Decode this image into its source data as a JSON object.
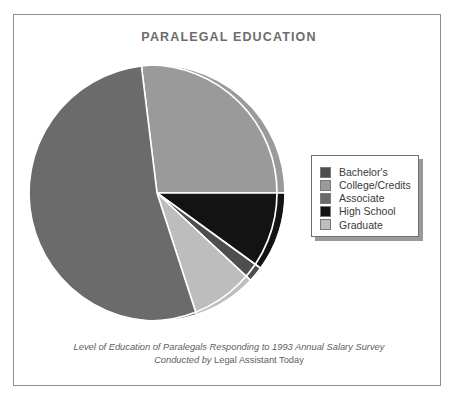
{
  "figure": {
    "title": "PARALEGAL EDUCATION",
    "caption_line1": "Level of Education of Paralegals Responding to 1993 Annual Salary Survey",
    "caption_line2_prefix": "Conducted by ",
    "caption_line2_source": "Legal Assistant Today",
    "frame_color": "#8d8d8d",
    "background": "#ffffff",
    "title_color": "#6c6c6c",
    "caption_color": "#5e5e5e"
  },
  "legend": {
    "position": "right-middle",
    "border_color": "#6f6f6f",
    "shadow_color": "#9a9a9a",
    "items": [
      {
        "label": "Bachelor's",
        "color": "#4e4e4e"
      },
      {
        "label": "College/Credits",
        "color": "#9a9a9a"
      },
      {
        "label": "Associate",
        "color": "#6b6b6b"
      },
      {
        "label": "High School",
        "color": "#131313"
      },
      {
        "label": "Graduate",
        "color": "#bdbdbd"
      }
    ]
  },
  "chart_data": {
    "type": "pie",
    "title": "PARALEGAL EDUCATION",
    "subtitle": "Level of Education of Paralegals Responding to 1993 Annual Salary Survey",
    "source": "Conducted by Legal Assistant Today",
    "legend_position": "right",
    "grid": false,
    "units": "percent",
    "start_angle_deg": -97,
    "direction": "clockwise",
    "labels": [
      "Bachelor's",
      "College/Credits",
      "Associate",
      "High School",
      "Graduate"
    ],
    "values": [
      2,
      27,
      53,
      10,
      8
    ],
    "colors": [
      "#4e4e4e",
      "#9a9a9a",
      "#6b6b6b",
      "#131313",
      "#bdbdbd"
    ],
    "slices": [
      {
        "label": "College/Credits",
        "value": 27,
        "color": "#9a9a9a",
        "start_deg": -97,
        "end_deg": 0,
        "exploded": false
      },
      {
        "label": "High School",
        "value": 10,
        "color": "#131313",
        "start_deg": 0,
        "end_deg": 36,
        "exploded": false
      },
      {
        "label": "Bachelor's",
        "value": 2,
        "color": "#4e4e4e",
        "start_deg": 36,
        "end_deg": 43,
        "exploded": false
      },
      {
        "label": "Graduate",
        "value": 8,
        "color": "#bdbdbd",
        "start_deg": 43,
        "end_deg": 72,
        "exploded": false
      },
      {
        "label": "Associate",
        "value": 53,
        "color": "#6b6b6b",
        "start_deg": 72,
        "end_deg": 263,
        "exploded": false
      }
    ]
  },
  "pie_geometry": {
    "center_x": 135,
    "center_y": 135,
    "radius": 128,
    "inner_arc_radius": 120,
    "separator_color": "#ffffff",
    "separator_width": 1.6
  }
}
